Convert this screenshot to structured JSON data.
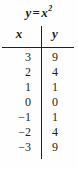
{
  "figure": {
    "title_lhs": "y",
    "title_operator": "=",
    "title_base": "x",
    "title_exponent": "2",
    "title_plain": "y = x2",
    "ink_color": "#231f20",
    "background_color": "#fefefe"
  },
  "table": {
    "columns": [
      {
        "key": "x",
        "header": "x"
      },
      {
        "key": "y",
        "header": "y"
      }
    ],
    "rows": [
      {
        "x": "3",
        "y": "9"
      },
      {
        "x": "2",
        "y": "4"
      },
      {
        "x": "1",
        "y": "1"
      },
      {
        "x": "0",
        "y": "0"
      },
      {
        "x": "−1",
        "y": "1"
      },
      {
        "x": "−2",
        "y": "4"
      },
      {
        "x": "−3",
        "y": "9"
      }
    ]
  },
  "chart_data": {
    "type": "table",
    "xlabel": "x",
    "ylabel": "y",
    "categories": [
      "3",
      "2",
      "1",
      "0",
      "-1",
      "-2",
      "-3"
    ],
    "x": [
      3,
      2,
      1,
      0,
      -1,
      -2,
      -3
    ],
    "values": [
      9,
      4,
      1,
      0,
      1,
      4,
      9
    ],
    "series": [
      {
        "name": "y",
        "values": [
          9,
          4,
          1,
          0,
          1,
          4,
          9
        ]
      }
    ],
    "grid": false,
    "legend": "none",
    "annotations": []
  }
}
